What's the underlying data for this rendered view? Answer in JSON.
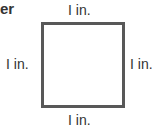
{
  "heading_fragment": "er",
  "figure": {
    "shape": "square",
    "side_labels": {
      "top": "I in.",
      "left": "I in.",
      "right": "I in.",
      "bottom": "I in."
    }
  }
}
